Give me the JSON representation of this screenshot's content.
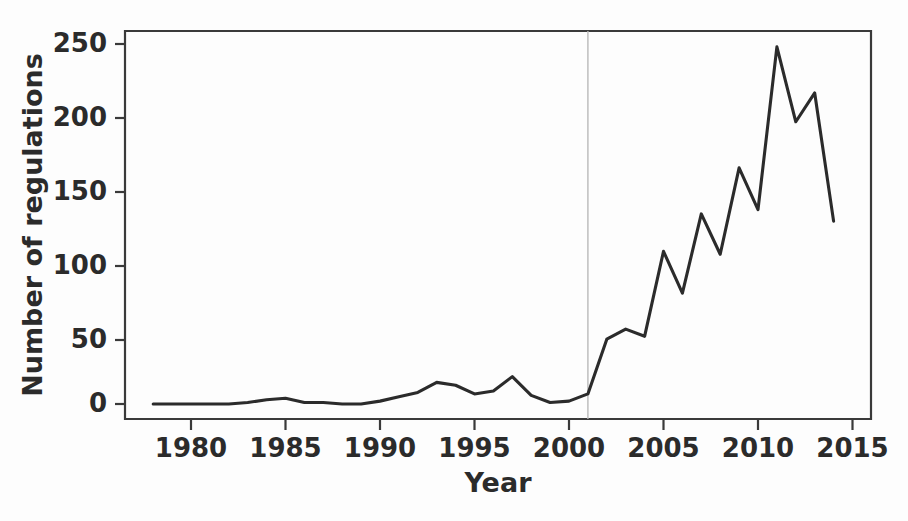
{
  "chart_data": {
    "type": "line",
    "title": "",
    "xlabel": "Year",
    "ylabel": "Number of regulations",
    "xlim": [
      1977.5,
      2015.5
    ],
    "ylim": [
      -10,
      260
    ],
    "xticks": [
      1980,
      1985,
      1990,
      1995,
      2000,
      2005,
      2010,
      2015
    ],
    "xtick_labels": [
      "1980",
      "1985",
      "1990",
      "1995",
      "2000",
      "2005",
      "2010",
      "2015"
    ],
    "yticks": [
      0,
      50,
      100,
      150,
      200,
      250
    ],
    "ytick_labels": [
      "0",
      "50",
      "100",
      "150",
      "200",
      "250"
    ],
    "grid": false,
    "legend": null,
    "line_color": "#2b2b2b",
    "axis_color": "#3a3a3a",
    "annotations": [
      {
        "name": "reference-line-2001",
        "type": "vline",
        "x": 2001,
        "color": "#b9b9b9",
        "label": ""
      }
    ],
    "x": [
      1978,
      1979,
      1980,
      1981,
      1982,
      1983,
      1984,
      1985,
      1986,
      1987,
      1988,
      1989,
      1990,
      1991,
      1992,
      1993,
      1994,
      1995,
      1996,
      1997,
      1998,
      1999,
      2000,
      2001,
      2002,
      2003,
      2004,
      2005,
      2006,
      2007,
      2008,
      2009,
      2010,
      2011,
      2012,
      2013,
      2014
    ],
    "values": [
      0,
      0,
      0,
      0,
      0,
      1,
      3,
      4,
      1,
      1,
      0,
      0,
      2,
      5,
      8,
      15,
      13,
      7,
      9,
      19,
      6,
      1,
      2,
      7,
      45,
      52,
      47,
      106,
      77,
      132,
      104,
      164,
      135,
      248,
      196,
      216,
      127
    ],
    "series": [
      {
        "name": "Number of regulations",
        "values": [
          0,
          0,
          0,
          0,
          0,
          1,
          3,
          4,
          1,
          1,
          0,
          0,
          2,
          5,
          8,
          15,
          13,
          7,
          9,
          19,
          6,
          1,
          2,
          7,
          45,
          52,
          47,
          106,
          77,
          132,
          104,
          164,
          135,
          248,
          196,
          216,
          127
        ]
      }
    ]
  }
}
